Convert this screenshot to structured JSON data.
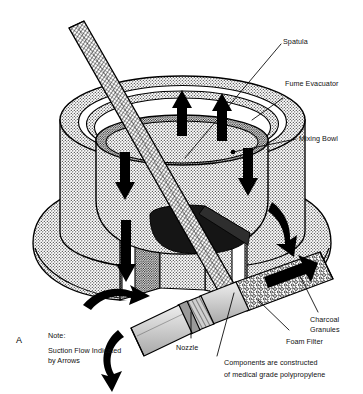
{
  "figure": {
    "id_label": "A",
    "domain_kind": "technical-cutaway-illustration"
  },
  "callouts": [
    {
      "key": "spatula",
      "label": "Spatula"
    },
    {
      "key": "fume_evacuator",
      "label": "Fume Evacuator"
    },
    {
      "key": "mixing_bowl",
      "label": "Mixing Bowl"
    },
    {
      "key": "charcoal_granules",
      "label": "Charcoal"
    },
    {
      "key": "charcoal_granules2",
      "label": "Granules"
    },
    {
      "key": "foam_filter",
      "label": "Foam Filter"
    },
    {
      "key": "nozzle",
      "label": "Nozzle"
    }
  ],
  "note": {
    "heading": "Note:",
    "line1": "Suction Flow Indicated",
    "line2": "by Arrows"
  },
  "caption": {
    "line1": "Components are constructed",
    "line2": "of medical grade polypropylene"
  },
  "colors": {
    "ink": "#000000",
    "background": "#ffffff",
    "stipple_light": "#d7d7d7",
    "stipple_mid": "#b4b4b4",
    "dark_fill": "#1a1a1a",
    "nozzle_gray": "#c9c9c9"
  },
  "flow_arrows": {
    "count": 8,
    "meaning": "Suction flow direction"
  }
}
